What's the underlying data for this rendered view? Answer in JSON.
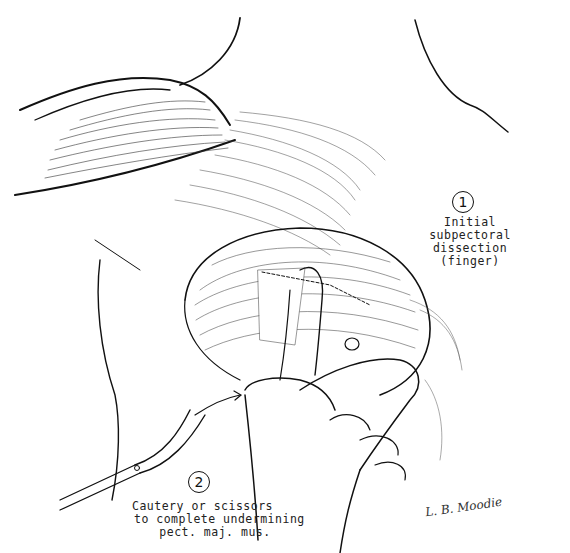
{
  "figure": {
    "type": "surgical-illustration"
  },
  "annotations": [
    {
      "number": "1",
      "lines": [
        "Initial",
        "subpectoral",
        "dissection",
        "(finger)"
      ]
    },
    {
      "number": "2",
      "lines": [
        "Cautery or scissors",
        "to complete undermining",
        "pect. maj. mus."
      ]
    }
  ],
  "signature": "L. B. Moodie",
  "colors": {
    "ink": "#111111",
    "background": "#ffffff"
  }
}
